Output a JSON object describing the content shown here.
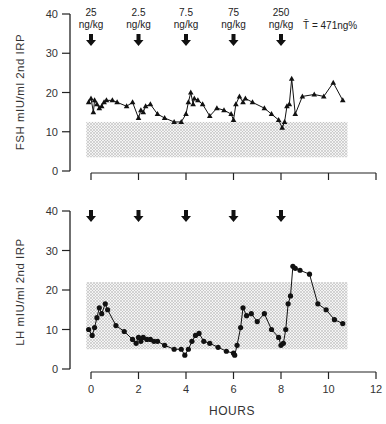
{
  "chart_data": [
    {
      "type": "line",
      "panel": "top",
      "ylabel": "FSH mIU/ml 2nd IRP",
      "yticks": [
        "0",
        "10",
        "20",
        "30",
        "40"
      ],
      "ylim": [
        0,
        40
      ],
      "xlim": [
        0,
        12
      ],
      "marker": "triangle",
      "normal_range_band": {
        "from_hour": -0.2,
        "to_hour": 10.8,
        "low": 3.5,
        "high": 12.5,
        "pattern": "stippled"
      },
      "dose_annotations": [
        {
          "hour": 0,
          "label": "25",
          "unit": "ng/kg"
        },
        {
          "hour": 2,
          "label": "2.5",
          "unit": "ng/kg"
        },
        {
          "hour": 4,
          "label": "7.5",
          "unit": "ng/kg"
        },
        {
          "hour": 6,
          "label": "75",
          "unit": "ng/kg"
        },
        {
          "hour": 8,
          "label": "250",
          "unit": "ng/kg"
        }
      ],
      "annotation": "T̄ = 471ng%",
      "x": [
        -0.1,
        0.0,
        0.1,
        0.15,
        0.25,
        0.35,
        0.45,
        0.55,
        0.65,
        0.9,
        1.1,
        1.5,
        1.75,
        2.0,
        2.1,
        2.2,
        2.3,
        2.5,
        2.8,
        3.1,
        3.5,
        3.8,
        4.0,
        4.1,
        4.2,
        4.3,
        4.35,
        4.5,
        4.7,
        5.0,
        5.3,
        5.6,
        5.9,
        6.0,
        6.1,
        6.25,
        6.4,
        6.5,
        6.8,
        7.3,
        7.6,
        7.9,
        8.05,
        8.15,
        8.25,
        8.35,
        8.45,
        8.6,
        8.9,
        9.4,
        9.8,
        10.2,
        10.6
      ],
      "values": [
        17.5,
        18.5,
        15.0,
        18.0,
        17.0,
        16.0,
        16.5,
        17.5,
        18.0,
        18.0,
        17.5,
        16.5,
        17.5,
        13.5,
        15.5,
        15.0,
        16.5,
        17.0,
        14.5,
        13.5,
        12.5,
        12.5,
        14.5,
        17.5,
        20.0,
        17.0,
        18.5,
        18.0,
        17.0,
        14.0,
        16.0,
        15.5,
        14.5,
        13.0,
        17.0,
        19.0,
        17.5,
        18.5,
        17.5,
        16.0,
        14.5,
        13.0,
        11.0,
        12.5,
        16.5,
        17.0,
        23.5,
        14.5,
        19.0,
        19.5,
        19.0,
        22.5,
        18.0,
        17.5,
        16.5
      ]
    },
    {
      "type": "line",
      "panel": "bottom",
      "ylabel": "LH mIU/ml 2nd IRP",
      "xlabel": "HOURS",
      "yticks": [
        "0",
        "10",
        "20",
        "30",
        "40"
      ],
      "xticks": [
        "0",
        "2",
        "4",
        "6",
        "8",
        "10",
        "12"
      ],
      "ylim": [
        0,
        40
      ],
      "xlim": [
        0,
        12
      ],
      "marker": "circle",
      "normal_range_band": {
        "from_hour": -0.2,
        "to_hour": 10.8,
        "low": 5.0,
        "high": 22.0,
        "pattern": "stippled"
      },
      "dose_arrows_hours": [
        0,
        2,
        4,
        6,
        8
      ],
      "x": [
        -0.1,
        0.05,
        0.15,
        0.25,
        0.35,
        0.45,
        0.6,
        0.7,
        1.05,
        1.4,
        1.75,
        1.9,
        2.0,
        2.1,
        2.2,
        2.35,
        2.5,
        2.65,
        2.8,
        3.1,
        3.5,
        3.8,
        3.95,
        4.1,
        4.25,
        4.4,
        4.55,
        4.75,
        5.0,
        5.35,
        5.7,
        6.0,
        6.05,
        6.15,
        6.3,
        6.4,
        6.55,
        6.75,
        7.0,
        7.3,
        7.6,
        7.9,
        8.0,
        8.1,
        8.2,
        8.3,
        8.4,
        8.5,
        8.6,
        8.8,
        9.2,
        9.55,
        9.9,
        10.25,
        10.6
      ],
      "values": [
        10.0,
        8.5,
        10.5,
        13.0,
        15.5,
        14.0,
        16.5,
        15.0,
        11.0,
        9.5,
        7.5,
        6.5,
        8.0,
        7.0,
        8.0,
        7.5,
        7.5,
        7.0,
        7.0,
        6.0,
        5.0,
        5.0,
        3.5,
        5.0,
        7.0,
        8.5,
        9.0,
        7.0,
        6.5,
        5.5,
        4.5,
        4.0,
        3.5,
        6.0,
        10.5,
        15.5,
        13.5,
        14.0,
        12.0,
        14.0,
        10.0,
        8.0,
        6.0,
        6.5,
        10.0,
        16.5,
        18.5,
        26.0,
        25.5,
        25.0,
        24.0,
        16.5,
        15.0,
        12.5,
        11.5
      ]
    }
  ],
  "labels": {
    "fsh_axis": "FSH mIU/ml 2nd IRP",
    "lh_axis": "LH mIU/ml 2nd IRP",
    "hours": "HOURS",
    "t_bar": "T̄ = 471ng%",
    "doses": [
      "25",
      "2.5",
      "7.5",
      "75",
      "250"
    ],
    "dose_unit": "ng/kg",
    "yticks": [
      "0",
      "10",
      "20",
      "30",
      "40"
    ],
    "xticks": [
      "0",
      "2",
      "4",
      "6",
      "8",
      "10",
      "12"
    ]
  }
}
